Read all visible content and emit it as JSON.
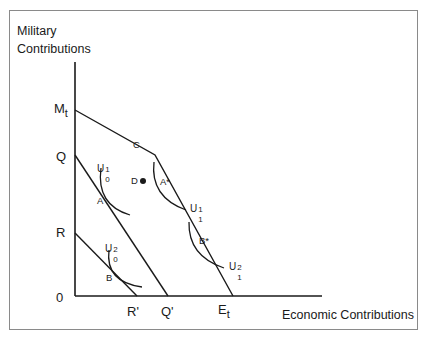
{
  "diagram": {
    "y_axis_title_line1": "Military",
    "y_axis_title_line2": "Contributions",
    "x_axis_title": "Economic Contributions",
    "origin_label": "0",
    "y_ticks": {
      "Mt_base": "M",
      "Mt_sub": "t",
      "Q": "Q",
      "R": "R"
    },
    "x_ticks": {
      "R_prime": "R'",
      "Q_prime": "Q'",
      "Et_base": "E",
      "Et_sub": "t"
    },
    "points": {
      "C": "C",
      "D": "D",
      "A": "A",
      "A_star": "A*",
      "B": "B",
      "B_star": "B*"
    },
    "curves": {
      "U01": {
        "base": "U",
        "sup": "1",
        "sub": "0"
      },
      "U02": {
        "base": "U",
        "sup": "2",
        "sub": "0"
      },
      "U11": {
        "base": "U",
        "sup": "1",
        "sub": "1"
      },
      "U12": {
        "base": "U",
        "sup": "2",
        "sub": "1"
      }
    },
    "lines": [
      {
        "name": "budget-Mt-C-Et",
        "from": "Mt",
        "via": "C",
        "to": "Et"
      },
      {
        "name": "budget-Q-Q'",
        "from": "Q",
        "to": "Q'"
      },
      {
        "name": "budget-R-R'",
        "from": "R",
        "to": "R'"
      }
    ],
    "colors": {
      "line": "#1a1a1a",
      "frame": "#8a8a8a"
    }
  }
}
